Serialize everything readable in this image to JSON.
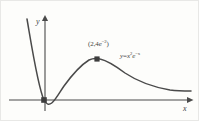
{
  "figure": {
    "kind": "cartesian-graph",
    "background_color": "#fdfdfb",
    "border_color": "#e8e8e6",
    "ink_color": "#4a4a4a",
    "axes": {
      "y_axis_label": "y",
      "x_axis_label": "x",
      "y_axis_x_px": 44,
      "x_axis_y_px": 99,
      "x_axis_start_px": 8,
      "x_axis_end_px": 186,
      "y_axis_top_px": 17,
      "show_ticks": false,
      "show_grid": false,
      "show_tick_labels": false
    },
    "annotations": {
      "max_point": {
        "text_plain": "(2, 4e^-2)",
        "open_paren": "(",
        "x_value": "2",
        "comma": ",",
        "coefficient": "4",
        "base": "e",
        "exponent": "−2",
        "close_paren": ")",
        "marker": "square-dot",
        "marker_x_px": 96,
        "marker_y_px": 58
      },
      "origin_point": {
        "text_plain": "",
        "marker": "square-dot",
        "marker_x_px": 43,
        "marker_y_px": 99
      },
      "curve_equation": {
        "text_plain": "y = x^2 e^-x",
        "lhs": "y",
        "equals": "=",
        "base_var": "x",
        "power": "2",
        "exp_base": "e",
        "exp_power": "−x"
      }
    }
  },
  "chart_data": {
    "type": "line",
    "title": "",
    "xlabel": "x",
    "ylabel": "y",
    "function": "y = x^2 * e^(-x)",
    "grid": false,
    "legend": "none",
    "marked_points": [
      {
        "label": "(2, 4e^-2)",
        "x": 2,
        "y": 0.5413
      },
      {
        "label": "origin",
        "x": 0,
        "y": 0
      }
    ],
    "curve_path_px": "M 26,18 C 31,47 37,86 43,99 C 49,111 56,95 63,85 C 71,74 80,64 88,59 C 92,57 95,57 99,58 C 108,60 116,66 124,72 C 136,80 152,86 169,89 C 177,90 184,90 190,90"
  }
}
